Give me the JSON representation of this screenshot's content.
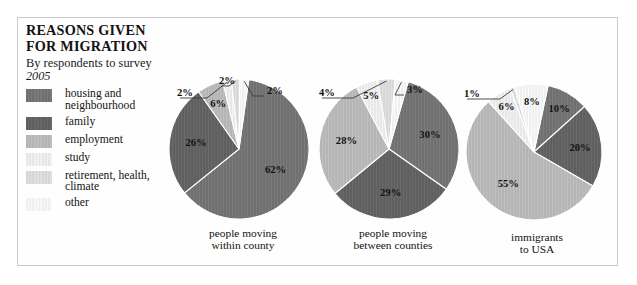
{
  "figure": {
    "title_lines": [
      "REASONS GIVEN",
      "FOR MIGRATION"
    ],
    "subtitle": "By respondents to survey",
    "year": "2005",
    "frame_color": "#c9c9c9",
    "background": "#ffffff"
  },
  "legend": {
    "items": [
      {
        "label": "housing and\nneighbourhood",
        "color": "#6f6f6f",
        "name": "housing-and-neighbourhood"
      },
      {
        "label": "family",
        "color": "#5e5e5e",
        "name": "family"
      },
      {
        "label": "employment",
        "color": "#b4b4b4",
        "name": "employment"
      },
      {
        "label": "study",
        "color": "#e7e7e7",
        "name": "study"
      },
      {
        "label": "retirement, health,\nclimate",
        "color": "#d6d6d6",
        "name": "retirement-health-climate"
      },
      {
        "label": "other",
        "color": "#efefef",
        "name": "other"
      }
    ]
  },
  "chart_data": {
    "type": "pie",
    "title": "REASONS GIVEN FOR MIGRATION",
    "subtitle": "By respondents to survey 2005",
    "unit": "percent",
    "legend_position": "left",
    "categories": [
      "housing and neighbourhood",
      "family",
      "employment",
      "study",
      "retirement, health, climate",
      "other"
    ],
    "category_colors": [
      "#6f6f6f",
      "#5e5e5e",
      "#b4b4b4",
      "#e7e7e7",
      "#d6d6d6",
      "#efefef"
    ],
    "charts": [
      {
        "name": "people-moving-within-county",
        "caption": "people moving\nwithin county",
        "values": [
          62,
          26,
          6,
          2,
          2,
          2
        ],
        "labels": [
          "62%",
          "26%",
          "6%",
          "2%",
          "2%",
          "2%"
        ]
      },
      {
        "name": "people-moving-between-counties",
        "caption": "people moving\nbetween counties",
        "values": [
          30,
          29,
          28,
          5,
          4,
          3
        ],
        "labels": [
          "30%",
          "29%",
          "28%",
          "5%",
          "4%",
          "3%"
        ]
      },
      {
        "name": "immigrants-to-usa",
        "caption": "immigrants\nto USA",
        "values": [
          10,
          20,
          55,
          6,
          1,
          8
        ],
        "labels": [
          "10%",
          "20%",
          "55%",
          "6%",
          "1%",
          "8%"
        ]
      }
    ]
  }
}
